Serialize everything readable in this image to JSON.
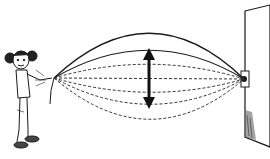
{
  "figure": {
    "colors": {
      "line": "#1a1a1a",
      "dashed": "#333333",
      "background": "#ffffff",
      "wall_shade": "#555555"
    },
    "rope_positions": 7,
    "arrow": "double-headed vertical arrow"
  }
}
